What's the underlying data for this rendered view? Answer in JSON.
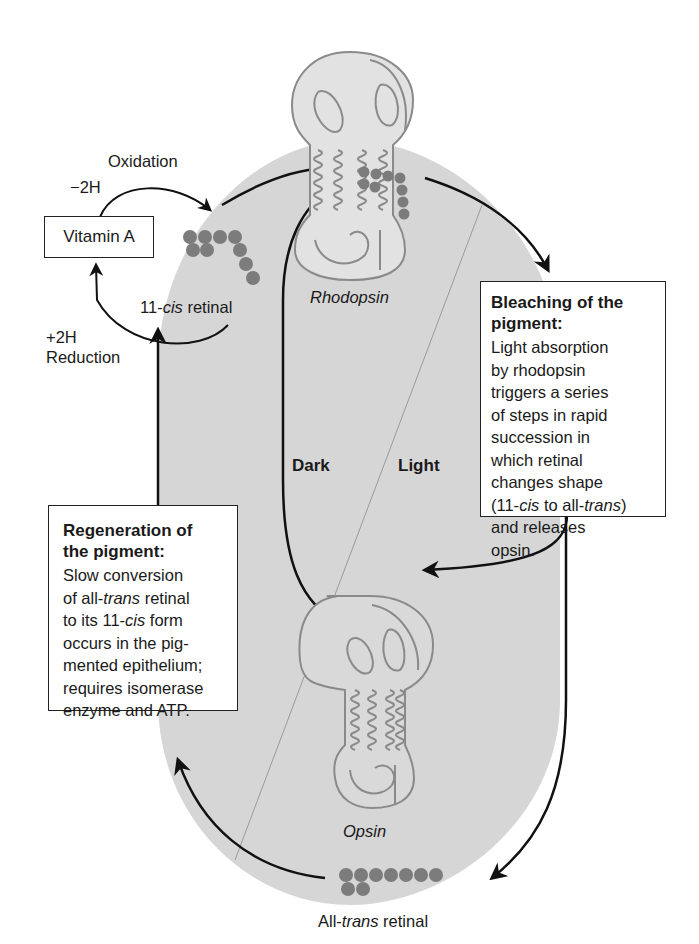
{
  "diagram": {
    "colors": {
      "cycle_fill": "#d6d6d6",
      "protein_stroke": "#8a8a8a",
      "retinal_bead": "#7c7c7c",
      "arrow": "#111111",
      "box_border": "#222222"
    },
    "vitamin_a": {
      "label": "Vitamin A",
      "oxidation_label": "Oxidation",
      "oxidation_h": "−2H",
      "reduction_label": "Reduction",
      "reduction_h": "+2H"
    },
    "molecules": {
      "cis_retinal_prefix": "11-",
      "cis_retinal_italic": "cis",
      "cis_retinal_suffix": " retinal",
      "rhodopsin": "Rhodopsin",
      "opsin": "Opsin",
      "trans_retinal_prefix": "All-",
      "trans_retinal_italic": "trans",
      "trans_retinal_suffix": " retinal"
    },
    "zones": {
      "dark": "Dark",
      "light": "Light"
    },
    "bleaching_box": {
      "title_line1": "Bleaching of the",
      "title_line2": "pigment:",
      "lines": [
        "Light absorption",
        "by rhodopsin",
        "triggers a series",
        "of steps in rapid",
        "succession in",
        "which retinal",
        "changes shape"
      ],
      "line8_a": "(11-",
      "line8_b": "cis",
      "line8_c": " to all-",
      "line8_d": "trans",
      "line8_e": ")",
      "line9": "and releases",
      "line10": "opsin."
    },
    "regeneration_box": {
      "title_line1": "Regeneration of",
      "title_line2": "the pigment:",
      "line1": "Slow conversion",
      "line2_a": "of all-",
      "line2_b": "trans",
      "line2_c": " retinal",
      "line3_a": "to its 11-",
      "line3_b": "cis",
      "line3_c": " form",
      "line4": "occurs in the pig-",
      "line5": "mented epithelium;",
      "line6": "requires isomerase",
      "line7": "enzyme and ATP."
    }
  }
}
